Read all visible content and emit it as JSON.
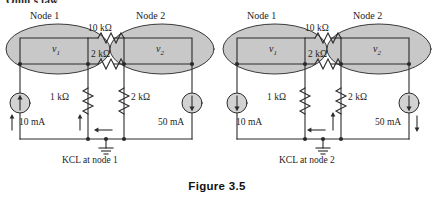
{
  "page": {
    "clipped_heading": "Ohm's law",
    "figure_caption": "Figure 3.5",
    "colors": {
      "node_fill": "#c8c8c8",
      "node_stroke": "#3a3a3a",
      "wire": "#2b2b2b",
      "text": "#1d1d1d",
      "background": "#ffffff"
    }
  },
  "circuits": [
    {
      "id": "kcl-node-1",
      "caption": "KCL at node 1",
      "nodes": [
        {
          "title": "Node 1",
          "voltage": "v",
          "voltage_sub": "1"
        },
        {
          "title": "Node 2",
          "voltage": "v",
          "voltage_sub": "2"
        }
      ],
      "series_resistors": [
        {
          "label": "10 kΩ"
        },
        {
          "label": "2 kΩ"
        }
      ],
      "shunt_resistors": [
        {
          "label": "1 kΩ"
        },
        {
          "label": "2 kΩ"
        }
      ],
      "sources": [
        {
          "label": "10 mA",
          "arrow": "up"
        },
        {
          "label": "50 mA",
          "arrow": "down"
        }
      ],
      "current_arrows": [
        {
          "name": "source-branch-current",
          "direction": "up"
        },
        {
          "name": "resistor-branch-current",
          "direction": "up"
        },
        {
          "name": "ground-return-current",
          "direction": "left"
        }
      ]
    },
    {
      "id": "kcl-node-2",
      "caption": "KCL at node 2",
      "nodes": [
        {
          "title": "Node 1",
          "voltage": "v",
          "voltage_sub": "1"
        },
        {
          "title": "Node 2",
          "voltage": "v",
          "voltage_sub": "2"
        }
      ],
      "series_resistors": [
        {
          "label": "10 kΩ"
        },
        {
          "label": "2 kΩ"
        }
      ],
      "shunt_resistors": [
        {
          "label": "1 kΩ"
        },
        {
          "label": "2 kΩ"
        }
      ],
      "sources": [
        {
          "label": "10 mA",
          "arrow": "down"
        },
        {
          "label": "50 mA",
          "arrow": "down"
        }
      ],
      "current_arrows": [
        {
          "name": "resistor-branch-current",
          "direction": "up"
        },
        {
          "name": "ground-return-current",
          "direction": "left"
        },
        {
          "name": "source-branch-current",
          "direction": "down"
        }
      ]
    }
  ]
}
